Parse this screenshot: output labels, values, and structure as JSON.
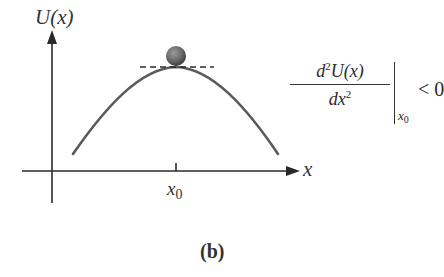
{
  "figure": {
    "caption": "(b)",
    "y_axis_label": "U(x)",
    "x_axis_label": "x",
    "tick_label": {
      "base": "x",
      "subscript": "0"
    },
    "formula": {
      "numerator_d": "d",
      "numerator_power": "2",
      "numerator_rest": "U(x)",
      "denominator_d": "dx",
      "denominator_power": "2",
      "evaluated_at_base": "x",
      "evaluated_at_subscript": "0",
      "relation": "< 0"
    },
    "colors": {
      "curve": "#5a5a5a",
      "axes": "#2a2a2a",
      "ball": "#6a6a6a",
      "background": "#ffffff"
    }
  }
}
